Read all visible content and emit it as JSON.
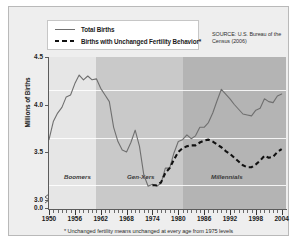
{
  "legend": {
    "items": [
      {
        "label": "Total Births",
        "style": "solid",
        "color": "#6f6f6f",
        "icon": "solid-line-icon"
      },
      {
        "label": "Births with Unchanged Fertility Behavior*",
        "style": "dashed",
        "color": "#111111",
        "icon": "dashed-line-icon"
      }
    ]
  },
  "source": "SOURCE: U.S. Bureau of the Census (2006)",
  "footnote": "* Unchanged fertility means unchanged at every age from 1975 levels",
  "colors": {
    "card_background": "#eeeeee",
    "band_boomers": "#e6e6e6",
    "band_genxers": "#c9c9c9",
    "band_millennials": "#b4b4b4",
    "total_births_line": "#6f6f6f",
    "unchanged_line": "#111111",
    "gridline": "#ffffff",
    "axis": "#5c5c5c"
  },
  "chart_data": {
    "type": "line",
    "title": "",
    "xlabel": "",
    "ylabel": "Millions of Births",
    "xlim": [
      1950,
      2005
    ],
    "ylim": [
      2.9,
      4.5
    ],
    "yticks": [
      4.5,
      4.0,
      3.5,
      3.0,
      0.0
    ],
    "ytick_labels": [
      "4.5",
      "4.0",
      "3.5",
      "3.0",
      "0.0"
    ],
    "y_axis_break": true,
    "xticks": [
      1950,
      1956,
      1962,
      1968,
      1974,
      1980,
      1986,
      1992,
      1998,
      2004
    ],
    "xtick_labels": [
      "1950",
      "1956",
      "1962",
      "1968",
      "1974",
      "1980",
      "1986",
      "1992",
      "1998",
      "2004"
    ],
    "x_minor_tick_interval": 1,
    "grid": "horizontal",
    "legend_position": "top-left",
    "bands": [
      {
        "label": "Boomers",
        "start": 1950,
        "end": 1961,
        "color": "#e6e6e6"
      },
      {
        "label": "Gen-Xers",
        "start": 1961,
        "end": 1981,
        "color": "#c9c9c9"
      },
      {
        "label": "Millennials",
        "start": 1981,
        "end": 2005,
        "color": "#b4b4b4"
      }
    ],
    "series": [
      {
        "name": "Total Births",
        "style": "solid",
        "color": "#6f6f6f",
        "x": [
          1950,
          1951,
          1952,
          1953,
          1954,
          1955,
          1956,
          1957,
          1958,
          1959,
          1960,
          1961,
          1962,
          1963,
          1964,
          1965,
          1966,
          1967,
          1968,
          1969,
          1970,
          1971,
          1972,
          1973,
          1974,
          1975,
          1976,
          1977,
          1978,
          1979,
          1980,
          1981,
          1982,
          1983,
          1984,
          1985,
          1986,
          1987,
          1988,
          1989,
          1990,
          1991,
          1992,
          1993,
          1994,
          1995,
          1996,
          1997,
          1998,
          1999,
          2000,
          2001,
          2002,
          2003,
          2004
        ],
        "values": [
          3.63,
          3.82,
          3.91,
          3.97,
          4.08,
          4.1,
          4.22,
          4.31,
          4.26,
          4.3,
          4.26,
          4.27,
          4.17,
          4.1,
          4.03,
          3.76,
          3.61,
          3.52,
          3.5,
          3.6,
          3.73,
          3.56,
          3.26,
          3.14,
          3.16,
          3.14,
          3.17,
          3.33,
          3.33,
          3.49,
          3.61,
          3.63,
          3.68,
          3.64,
          3.67,
          3.76,
          3.76,
          3.81,
          3.91,
          4.04,
          4.16,
          4.11,
          4.06,
          4.0,
          3.95,
          3.9,
          3.89,
          3.88,
          3.94,
          3.96,
          4.06,
          4.03,
          4.02,
          4.09,
          4.11
        ]
      },
      {
        "name": "Births with Unchanged Fertility Behavior*",
        "style": "dashed",
        "color": "#111111",
        "x": [
          1974,
          1975,
          1976,
          1977,
          1978,
          1979,
          1980,
          1981,
          1982,
          1983,
          1984,
          1985,
          1986,
          1987,
          1988,
          1989,
          1990,
          1991,
          1992,
          1993,
          1994,
          1995,
          1996,
          1997,
          1998,
          1999,
          2000,
          2001,
          2002,
          2003,
          2004
        ],
        "values": [
          3.15,
          3.15,
          3.18,
          3.28,
          3.33,
          3.42,
          3.5,
          3.54,
          3.56,
          3.57,
          3.57,
          3.6,
          3.62,
          3.63,
          3.61,
          3.58,
          3.55,
          3.51,
          3.48,
          3.44,
          3.4,
          3.36,
          3.34,
          3.34,
          3.37,
          3.41,
          3.46,
          3.44,
          3.45,
          3.5,
          3.53
        ]
      }
    ]
  }
}
